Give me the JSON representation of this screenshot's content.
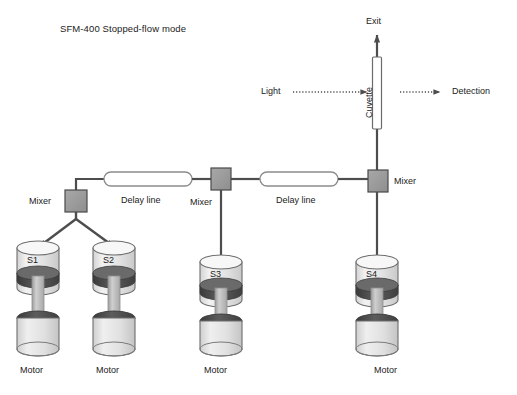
{
  "diagram": {
    "title": "SFM-400 Stopped-flow mode",
    "background_color": "#ffffff",
    "line_color": "#4d4d4d",
    "mixer_fill": "#9b9b9b",
    "mixer_stroke": "#4a4a4a",
    "delay_fill": "#ffffff",
    "delay_stroke": "#8c8c8c",
    "cuvette_fill": "#ffffff",
    "cuvette_stroke": "#6b6b6b",
    "syringe_fill": "#e8e8e8",
    "syringe_stroke": "#6d6d6d",
    "plunger_fill": "#4a4a4a",
    "rod_fill": "#b8b8b8",
    "text_color": "#1b1b1b"
  },
  "optics": {
    "exit_label": "Exit",
    "light_label": "Light",
    "cuvette_label": "Cuvette",
    "detection_label": "Detection"
  },
  "flow": {
    "mixers": [
      {
        "id": "mixer-1",
        "label": "Mixer"
      },
      {
        "id": "mixer-2",
        "label": "Mixer"
      },
      {
        "id": "mixer-3",
        "label": "Mixer"
      }
    ],
    "delay_lines": [
      {
        "id": "delay-line-1",
        "label": "Delay line"
      },
      {
        "id": "delay-line-2",
        "label": "Delay line"
      }
    ]
  },
  "syringes": [
    {
      "id": "syringe-s1",
      "label": "S1",
      "motor_label": "Motor"
    },
    {
      "id": "syringe-s2",
      "label": "S2",
      "motor_label": "Motor"
    },
    {
      "id": "syringe-s3",
      "label": "S3",
      "motor_label": "Motor"
    },
    {
      "id": "syringe-s4",
      "label": "S4",
      "motor_label": "Motor"
    }
  ]
}
